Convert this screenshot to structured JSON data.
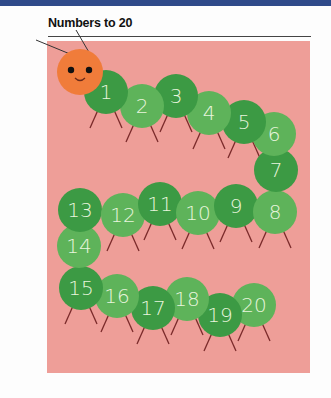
{
  "page": {
    "title": "Numbers to 20",
    "colors": {
      "header_bar": "#2f4a8a",
      "panel_background": "#ee9e98",
      "caterpillar_head": "#f07c3a",
      "segment_dark": "#3c9a44",
      "segment_light": "#5eb35a",
      "legs": "#7a2a2a",
      "numerals": "#e8f5dd"
    }
  },
  "caterpillar": {
    "head": {
      "cx": 80,
      "cy": 72,
      "r": 23,
      "eyes": 2,
      "smile": true,
      "antennae": 2
    },
    "segments": [
      {
        "label": "1",
        "cx": 106,
        "cy": 92,
        "r": 22,
        "shade": "dark"
      },
      {
        "label": "2",
        "cx": 142,
        "cy": 106,
        "r": 22,
        "shade": "light"
      },
      {
        "label": "3",
        "cx": 176,
        "cy": 96,
        "r": 22,
        "shade": "dark"
      },
      {
        "label": "4",
        "cx": 209,
        "cy": 113,
        "r": 22,
        "shade": "light"
      },
      {
        "label": "5",
        "cx": 244,
        "cy": 122,
        "r": 22,
        "shade": "dark"
      },
      {
        "label": "6",
        "cx": 274,
        "cy": 134,
        "r": 22,
        "shade": "light"
      },
      {
        "label": "7",
        "cx": 276,
        "cy": 170,
        "r": 22,
        "shade": "dark"
      },
      {
        "label": "8",
        "cx": 275,
        "cy": 212,
        "r": 22,
        "shade": "light"
      },
      {
        "label": "9",
        "cx": 236,
        "cy": 206,
        "r": 22,
        "shade": "dark"
      },
      {
        "label": "10",
        "cx": 198,
        "cy": 213,
        "r": 22,
        "shade": "light"
      },
      {
        "label": "11",
        "cx": 160,
        "cy": 204,
        "r": 22,
        "shade": "dark"
      },
      {
        "label": "12",
        "cx": 123,
        "cy": 215,
        "r": 22,
        "shade": "light"
      },
      {
        "label": "13",
        "cx": 80,
        "cy": 210,
        "r": 22,
        "shade": "dark"
      },
      {
        "label": "14",
        "cx": 79,
        "cy": 246,
        "r": 22,
        "shade": "light"
      },
      {
        "label": "15",
        "cx": 81,
        "cy": 288,
        "r": 22,
        "shade": "dark"
      },
      {
        "label": "16",
        "cx": 117,
        "cy": 296,
        "r": 22,
        "shade": "light"
      },
      {
        "label": "17",
        "cx": 153,
        "cy": 308,
        "r": 22,
        "shade": "dark"
      },
      {
        "label": "18",
        "cx": 187,
        "cy": 299,
        "r": 22,
        "shade": "light"
      },
      {
        "label": "19",
        "cx": 220,
        "cy": 315,
        "r": 22,
        "shade": "dark"
      },
      {
        "label": "20",
        "cx": 254,
        "cy": 305,
        "r": 22,
        "shade": "light"
      }
    ]
  }
}
